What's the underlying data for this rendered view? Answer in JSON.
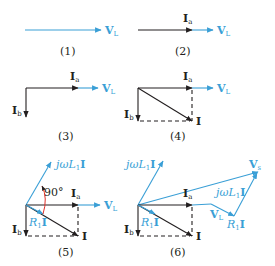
{
  "figure": {
    "colors": {
      "current": "#231f20",
      "voltage": "#3a9fd6",
      "angle_arc": "#e0302a"
    },
    "panels": [
      {
        "caption": "(1)",
        "labels": {
          "vl": "V",
          "vl_sub": "L"
        }
      },
      {
        "caption": "(2)",
        "labels": {
          "ia": "I",
          "ia_sub": "a",
          "vl": "V",
          "vl_sub": "L"
        }
      },
      {
        "caption": "(3)",
        "labels": {
          "ia": "I",
          "ia_sub": "a",
          "ib": "I",
          "ib_sub": "b",
          "vl": "V",
          "vl_sub": "L"
        }
      },
      {
        "caption": "(4)",
        "labels": {
          "ia": "I",
          "ia_sub": "a",
          "ib": "I",
          "ib_sub": "b",
          "i": "I",
          "vl": "V",
          "vl_sub": "L"
        }
      },
      {
        "caption": "(5)",
        "labels": {
          "ia": "I",
          "ia_sub": "a",
          "ib": "I",
          "ib_sub": "b",
          "i": "I",
          "vl": "V",
          "vl_sub": "L",
          "jwl": "jωL",
          "jwl_sub": "1",
          "jwl_i": "I",
          "r1": "R",
          "r1_sub": "1",
          "r1_i": "I",
          "angle": "90°"
        }
      },
      {
        "caption": "(6)",
        "labels": {
          "ia": "I",
          "ia_sub": "a",
          "ib": "I",
          "ib_sub": "b",
          "i": "I",
          "vl": "V",
          "vl_sub": "L",
          "jwl": "jωL",
          "jwl_sub": "1",
          "jwl_i": "I",
          "r1": "R",
          "r1_sub": "1",
          "r1_i": "I",
          "vs": "V",
          "vs_sub": "s",
          "jwl2": "jωL",
          "jwl2_sub": "1",
          "jwl2_i": "I",
          "r1b": "R",
          "r1b_sub": "1",
          "r1b_i": "I",
          "vl2": "V",
          "vl2_sub": "L"
        }
      }
    ]
  }
}
